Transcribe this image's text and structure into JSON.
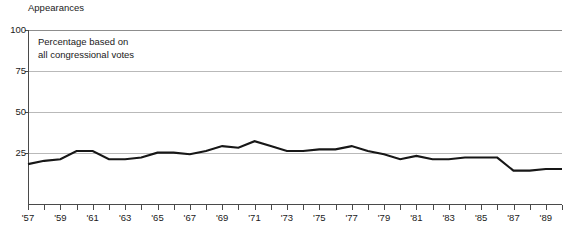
{
  "chart_data": {
    "type": "line",
    "title": "",
    "ylabel": "Appearances",
    "xlabel": "",
    "annotation": "Percentage based on\nall congressional votes",
    "ylim": [
      -7,
      100
    ],
    "yticks": [
      100,
      75,
      50,
      25
    ],
    "ytick_labels": [
      "100",
      "75",
      "50",
      "25"
    ],
    "grid": true,
    "legend": "none",
    "xlim": [
      1957,
      1990
    ],
    "xtick_labels": [
      "'57",
      "'59",
      "'61",
      "'63",
      "'65",
      "'67",
      "'69",
      "'71",
      "'73",
      "'75",
      "'77",
      "'79",
      "'81",
      "'83",
      "'85",
      "'87",
      "'89"
    ],
    "xtick_years": [
      1957,
      1959,
      1961,
      1963,
      1965,
      1967,
      1969,
      1971,
      1973,
      1975,
      1977,
      1979,
      1981,
      1983,
      1985,
      1987,
      1989
    ],
    "x": [
      1957,
      1958,
      1959,
      1960,
      1961,
      1962,
      1963,
      1964,
      1965,
      1966,
      1967,
      1968,
      1969,
      1970,
      1971,
      1972,
      1973,
      1974,
      1975,
      1976,
      1977,
      1978,
      1979,
      1980,
      1981,
      1982,
      1983,
      1984,
      1985,
      1986,
      1987,
      1988,
      1989,
      1990
    ],
    "values": [
      18,
      20,
      21,
      26,
      26,
      21,
      21,
      22,
      25,
      25,
      24,
      26,
      29,
      28,
      32,
      29,
      26,
      26,
      27,
      27,
      29,
      26,
      24,
      21,
      23,
      21,
      21,
      22,
      22,
      22,
      14,
      14,
      15,
      15
    ],
    "series_name": "Appearances"
  },
  "axis": {
    "y_axis_title": "Appearances"
  }
}
